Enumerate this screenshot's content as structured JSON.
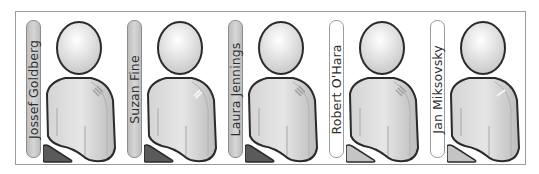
{
  "people": [
    {
      "name": "Jossef Goldberg",
      "state": "selected"
    },
    {
      "name": "Suzan Fine",
      "state": "selected"
    },
    {
      "name": "Laura Jennings",
      "state": "selected"
    },
    {
      "name": "Robert O'Hara",
      "state": "unselected"
    },
    {
      "name": "Jan Miksovsky",
      "state": "unselected"
    }
  ],
  "colors": {
    "pill_selected": "#c8c8c8",
    "pill_unselected": "#ffffff",
    "triangle_selected": "#5a5a5a",
    "triangle_unselected": "#c4c4c4",
    "outline": "#2a2a2a",
    "frame_border": "#9a9a9a"
  }
}
